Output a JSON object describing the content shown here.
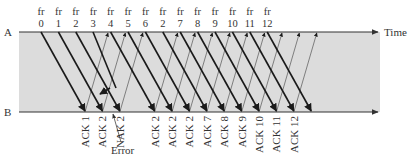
{
  "diagram": {
    "type": "go-back-n-timing",
    "station_a_label": "A",
    "station_b_label": "B",
    "time_label": "Time",
    "error_label": "Error",
    "colors": {
      "shaded_region": "#dcdcdc",
      "frame_line": "#1a1a1a",
      "ack_line": "#555555",
      "axis_line": "#333333"
    },
    "frames": [
      {
        "prefix": "fr",
        "num": "0"
      },
      {
        "prefix": "fr",
        "num": "1"
      },
      {
        "prefix": "fr",
        "num": "2"
      },
      {
        "prefix": "fr",
        "num": "3"
      },
      {
        "prefix": "fr",
        "num": "4"
      },
      {
        "prefix": "fr",
        "num": "5"
      },
      {
        "prefix": "fr",
        "num": "6"
      },
      {
        "prefix": "fr",
        "num": "2"
      },
      {
        "prefix": "fr",
        "num": "7"
      },
      {
        "prefix": "fr",
        "num": "8"
      },
      {
        "prefix": "fr",
        "num": "9"
      },
      {
        "prefix": "fr",
        "num": "10"
      },
      {
        "prefix": "fr",
        "num": "11"
      },
      {
        "prefix": "fr",
        "num": "12"
      }
    ],
    "responses": [
      "ACK 1",
      "ACK 2",
      "NAK 2",
      "ACK 2",
      "ACK 2",
      "ACK 2",
      "ACK 7",
      "ACK 8",
      "ACK 9",
      "ACK 10",
      "ACK 11",
      "ACK 12"
    ]
  }
}
